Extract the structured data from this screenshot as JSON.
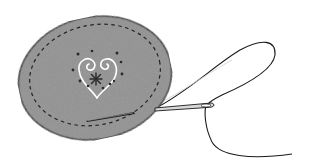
{
  "illustration": {
    "description": "Gray felt oval with dashed running-stitch border, white spiral heart embroidery with dark French knots and a star stitch, a needle inserted at the lower right with thread looping away",
    "colors": {
      "felt": "#8c8c8c",
      "outline": "#1a1a1a",
      "stitch_dashes": "#222222",
      "heart_embroidery": "#ffffff",
      "knots": "#2a2a2a",
      "needle": "#d8d8d8",
      "thread": "#1a1a1a",
      "background": "#ffffff"
    },
    "elements": [
      {
        "name": "felt-oval"
      },
      {
        "name": "running-stitch-border"
      },
      {
        "name": "spiral-heart-embroidery"
      },
      {
        "name": "french-knots"
      },
      {
        "name": "star-stitch"
      },
      {
        "name": "stitch-slot"
      },
      {
        "name": "needle"
      },
      {
        "name": "thread"
      }
    ]
  }
}
